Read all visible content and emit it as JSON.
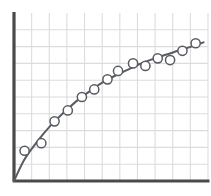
{
  "figure": {
    "width": 211,
    "height": 196,
    "background": "#ffffff",
    "axis_color": "#4a4a4a",
    "grid_color": "#dcdcdc",
    "curve_color": "#595b63",
    "marker_fill": "#ffffff",
    "marker_stroke": "#595b63"
  },
  "chart_data": {
    "type": "scatter",
    "title": "",
    "subtitle": "",
    "xlabel": "",
    "ylabel": "",
    "xlim": [
      0,
      11
    ],
    "ylim": [
      0,
      10
    ],
    "grid": true,
    "grid_x_lines": 11,
    "grid_y_lines": 10,
    "legend": "none",
    "xticklabels": [],
    "yticklabels": [],
    "annotations": [],
    "series": [
      {
        "name": "observations",
        "type": "scatter",
        "marker": "open-circle",
        "marker_radius": 4.6,
        "x": [
          0.6,
          1.55,
          2.3,
          3.05,
          3.85,
          4.55,
          5.3,
          5.9,
          6.75,
          7.45,
          8.15,
          8.85,
          9.55,
          10.3
        ],
        "y": [
          1.8,
          2.25,
          3.55,
          4.2,
          5.0,
          5.45,
          6.05,
          6.55,
          7.0,
          6.85,
          7.3,
          7.2,
          7.75,
          8.2
        ]
      },
      {
        "name": "fitted-curve",
        "type": "line",
        "description": "concave-down increasing trend line through origin",
        "x": [
          0.0,
          0.55,
          1.1,
          1.7,
          2.3,
          2.95,
          3.6,
          4.3,
          5.0,
          5.7,
          6.4,
          7.1,
          7.85,
          8.55,
          9.3,
          10.05,
          10.75
        ],
        "y": [
          0.0,
          1.2,
          2.05,
          2.85,
          3.55,
          4.2,
          4.8,
          5.35,
          5.85,
          6.25,
          6.6,
          6.95,
          7.25,
          7.5,
          7.75,
          8.0,
          8.25
        ]
      }
    ]
  }
}
